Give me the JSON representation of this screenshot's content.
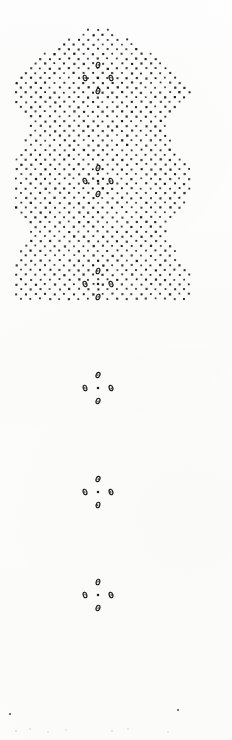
{
  "document": {
    "kind": "scanned-halftone-plate",
    "title": "Dot lattice pattern plate",
    "width": 232,
    "height": 740,
    "background_color": "#fdfdfc",
    "ink_color": "#1a1a1a",
    "caption": ""
  },
  "chart_data": {
    "type": "scatter",
    "subtitle": "",
    "xlabel": "",
    "ylabel": "",
    "xlim": [
      0,
      232
    ],
    "ylim": [
      0,
      740
    ],
    "grid": false,
    "legend_position": "none",
    "annotations": [],
    "tick_labels": {
      "x": [],
      "y": []
    },
    "lattice": {
      "orientation": "diagonal",
      "spacing_px": 9.6,
      "row_spacing_px": 9.6,
      "origin_x": 98,
      "origin_y": 78,
      "dot_size_px": 2.0,
      "dot_color": "#1a1a1a"
    },
    "band": {
      "center_x": 98,
      "top_y": 28,
      "bottom_y": 700,
      "left_min_x": 12,
      "right_max_x": 196,
      "half_width_bulge_px": 96,
      "half_width_pinch_px": 70,
      "undulation_period_px": 103.4,
      "top_cap": "dome",
      "bottom_cap": "angled-taper"
    },
    "motifs": {
      "count": 6,
      "glyph": "ring",
      "glyph_count_per_motif": 4,
      "glyph_arrangement": "diamond",
      "glyph_offset_px": 13,
      "center_x": 98,
      "centers_y": [
        78,
        181,
        284,
        388,
        492,
        595
      ],
      "period_px": 103.4
    },
    "series": [
      {
        "name": "lattice dots",
        "marker": "square",
        "color": "#1a1a1a",
        "size_px": 2.0,
        "approx_count": 1150
      },
      {
        "name": "motif rings",
        "marker": "ring",
        "color": "#111111",
        "size_px": 4.5,
        "approx_count": 24
      },
      {
        "name": "bottom specks",
        "marker": "speck",
        "color": "#bdbdbd",
        "size_px": 1.5,
        "approx_count": 9
      }
    ]
  },
  "bottom_specks": [
    {
      "x": 10,
      "y": 8,
      "o": 0.85
    },
    {
      "x": 178,
      "y": 4,
      "o": 0.8
    },
    {
      "x": 16,
      "y": 25,
      "o": 0.16
    },
    {
      "x": 30,
      "y": 23,
      "o": 0.14
    },
    {
      "x": 48,
      "y": 26,
      "o": 0.13
    },
    {
      "x": 66,
      "y": 24,
      "o": 0.11
    },
    {
      "x": 112,
      "y": 25,
      "o": 0.15
    },
    {
      "x": 128,
      "y": 23,
      "o": 0.12
    },
    {
      "x": 168,
      "y": 26,
      "o": 0.12
    }
  ]
}
